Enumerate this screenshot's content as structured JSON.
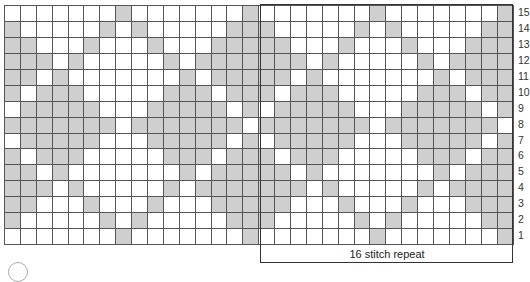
{
  "chart": {
    "columns": 32,
    "rows": 15,
    "colors": {
      "contrast": "#cfcfcf",
      "background": "#ffffff",
      "grid_line": "#555555"
    },
    "repeat_width": 16,
    "repeat_label": "16 stitch repeat",
    "row_numbers": [
      "15",
      "14",
      "13",
      "12",
      "11",
      "10",
      "9",
      "8",
      "7",
      "6",
      "5",
      "4",
      "3",
      "2",
      "1"
    ],
    "pattern_rows_top_to_bottom": [
      ".......X.......X",
      "X.....X.X.....XX",
      "XX...X...X...XXX",
      "XXX.X.....X.XXXX",
      "XX.X.......X.XXX",
      "X.XXX.....XXX.XX",
      ".XXXXX...XXXXX.X",
      "XXXXXXX.XXXXXXX.",
      ".XXXXX...XXXXX.X",
      "X.XXX.....XXX.XX",
      "XX.X.......X.XXX",
      "XXX.X.....X.XXXX",
      "XX...X...X...XXX",
      "X.....X.X.....XX",
      ".......X.......X"
    ]
  }
}
